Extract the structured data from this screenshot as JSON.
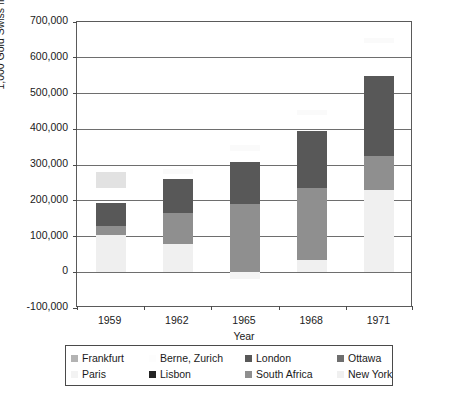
{
  "chart_data": {
    "type": "bar",
    "subtype": "stacked-column",
    "title": "",
    "xlabel": "Year",
    "ylabel": "1,000 Gold Swiss francs",
    "categories": [
      "1959",
      "1962",
      "1965",
      "1968",
      "1971"
    ],
    "ylim": [
      -100000,
      700000
    ],
    "ytick_labels": [
      "700,000",
      "600,000",
      "500,000",
      "400,000",
      "300,000",
      "200,000",
      "100,000",
      "0",
      "-100,000"
    ],
    "ytick_values": [
      700000,
      600000,
      500000,
      400000,
      300000,
      200000,
      100000,
      0,
      -100000
    ],
    "grid": true,
    "grid_axis": "y",
    "legend_position": "below-plot",
    "series": [
      {
        "name": "Frankfurt",
        "color": "#b3b3b3",
        "values": [
          45000,
          0,
          0,
          0,
          0
        ]
      },
      {
        "name": "Berne, Zurich",
        "color": "#fbfbfb",
        "values": [
          0,
          15000,
          15000,
          12000,
          14000
        ]
      },
      {
        "name": "London",
        "color": "#585858",
        "values": [
          65000,
          97000,
          205000,
          160000,
          225000
        ]
      },
      {
        "name": "Ottawa",
        "color": "#6e6e6e",
        "values": [
          0,
          0,
          0,
          0,
          0
        ]
      },
      {
        "name": "Paris",
        "color": "#f2f2f2",
        "values": [
          0,
          0,
          0,
          0,
          0
        ]
      },
      {
        "name": "Lisbon",
        "color": "#2b2b2b",
        "values": [
          0,
          0,
          0,
          0,
          0
        ]
      },
      {
        "name": "South Africa",
        "color": "#8f8f8f",
        "values": [
          27000,
          85000,
          205000,
          200000,
          95000
        ]
      },
      {
        "name": "New York",
        "color": "#efefef",
        "values": [
          103000,
          80000,
          0,
          35000,
          230000
        ]
      }
    ],
    "bar_totals": [
      195000,
      262000,
      307000,
      395000,
      550000
    ],
    "cap_marker_tops": [
      280000,
      290000,
      355000,
      455000,
      655000
    ],
    "bars": [
      {
        "category": "1959",
        "segments": [
          {
            "series": "New York",
            "from": 0,
            "to": 103000,
            "color": "#efefef"
          },
          {
            "series": "South Africa",
            "from": 103000,
            "to": 130000,
            "color": "#8f8f8f"
          },
          {
            "series": "London",
            "from": 130000,
            "to": 195000,
            "color": "#585858"
          },
          {
            "series": "Frankfurt",
            "from": 235000,
            "to": 280000,
            "color": "#e2e2e2"
          }
        ]
      },
      {
        "category": "1962",
        "segments": [
          {
            "series": "New York",
            "from": 0,
            "to": 80000,
            "color": "#f0f0f0"
          },
          {
            "series": "South Africa",
            "from": 80000,
            "to": 165000,
            "color": "#8f8f8f"
          },
          {
            "series": "London",
            "from": 165000,
            "to": 262000,
            "color": "#585858"
          },
          {
            "series": "Berne, Zurich",
            "from": 275000,
            "to": 290000,
            "color": "#fafafa"
          }
        ]
      },
      {
        "category": "1965",
        "segments": [
          {
            "series": "New York",
            "from": -18000,
            "to": 0,
            "color": "#f4f4f4"
          },
          {
            "series": "South Africa",
            "from": 0,
            "to": 190000,
            "color": "#8f8f8f"
          },
          {
            "series": "London",
            "from": 190000,
            "to": 307000,
            "color": "#585858"
          },
          {
            "series": "Berne, Zurich",
            "from": 340000,
            "to": 355000,
            "color": "#fafafa"
          }
        ]
      },
      {
        "category": "1968",
        "segments": [
          {
            "series": "New York",
            "from": 0,
            "to": 35000,
            "color": "#f0f0f0"
          },
          {
            "series": "South Africa",
            "from": 35000,
            "to": 235000,
            "color": "#8f8f8f"
          },
          {
            "series": "London",
            "from": 235000,
            "to": 395000,
            "color": "#585858"
          },
          {
            "series": "Berne, Zurich",
            "from": 440000,
            "to": 455000,
            "color": "#fafafa"
          }
        ]
      },
      {
        "category": "1971",
        "segments": [
          {
            "series": "New York",
            "from": 0,
            "to": 230000,
            "color": "#f0f0f0"
          },
          {
            "series": "South Africa",
            "from": 230000,
            "to": 325000,
            "color": "#8f8f8f"
          },
          {
            "series": "London",
            "from": 325000,
            "to": 550000,
            "color": "#585858"
          },
          {
            "series": "Berne, Zurich",
            "from": 640000,
            "to": 655000,
            "color": "#fafafa"
          }
        ]
      }
    ]
  },
  "legend": {
    "entries": [
      {
        "label": "Frankfurt",
        "color": "#b3b3b3"
      },
      {
        "label": "Berne, Zurich",
        "color": "#fdfdfd"
      },
      {
        "label": "London",
        "color": "#585858"
      },
      {
        "label": "Ottawa",
        "color": "#6e6e6e"
      },
      {
        "label": "Paris",
        "color": "#f3f3f3"
      },
      {
        "label": "Lisbon",
        "color": "#242424"
      },
      {
        "label": "South Africa",
        "color": "#8f8f8f"
      },
      {
        "label": "New York",
        "color": "#f0f0f0"
      }
    ]
  },
  "colors": {
    "axis": "#4a4a4a",
    "grid": "#6e6e6e",
    "frame": "#5a5a5a",
    "text": "#1a1a1a",
    "background": "#ffffff"
  }
}
